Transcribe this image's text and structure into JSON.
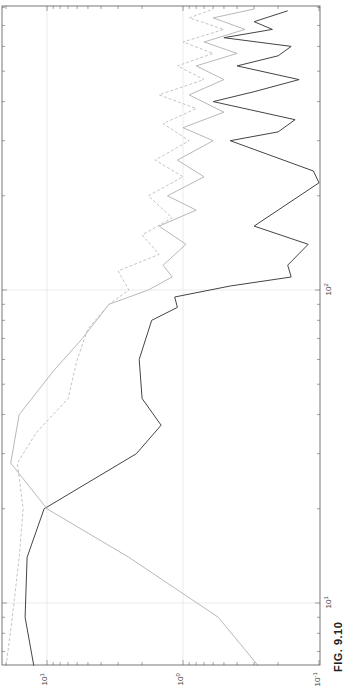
{
  "figure": {
    "label": "FIG. 9.10"
  },
  "chart_data": {
    "type": "line",
    "title": "",
    "orientation": "rotated-90-ccw",
    "xlabel": "",
    "ylabel": "",
    "xscale": "log",
    "yscale": "log",
    "xlim": [
      6,
      800
    ],
    "ylim": [
      0.1,
      20
    ],
    "grid": true,
    "x_tick_labels": [
      "10^1",
      "10^2"
    ],
    "y_tick_labels": [
      "10^-1",
      "10^0",
      "10^1"
    ],
    "legend": null,
    "series": [
      {
        "name": "series-dark-solid",
        "color": "#444444",
        "style": "solid",
        "points": [
          [
            6.3,
            12.5
          ],
          [
            9,
            14.5
          ],
          [
            14,
            14
          ],
          [
            20,
            10.5
          ],
          [
            30,
            2.2
          ],
          [
            37,
            1.45
          ],
          [
            45,
            2.0
          ],
          [
            60,
            2.1
          ],
          [
            80,
            1.7
          ],
          [
            88,
            1.1
          ],
          [
            95,
            1.15
          ],
          [
            103,
            0.45
          ],
          [
            110,
            0.16
          ],
          [
            120,
            0.17
          ],
          [
            140,
            0.12
          ],
          [
            160,
            0.3
          ],
          [
            180,
            0.2
          ],
          [
            220,
            0.1
          ],
          [
            240,
            0.11
          ],
          [
            300,
            0.45
          ],
          [
            320,
            0.2
          ],
          [
            350,
            0.15
          ],
          [
            400,
            0.6
          ],
          [
            430,
            0.3
          ],
          [
            470,
            0.14
          ],
          [
            520,
            0.4
          ],
          [
            560,
            0.2
          ],
          [
            600,
            0.16
          ],
          [
            640,
            0.5
          ],
          [
            680,
            0.22
          ],
          [
            720,
            0.3
          ],
          [
            780,
            0.17
          ]
        ]
      },
      {
        "name": "series-light-solid",
        "color": "#b0b0b0",
        "style": "solid",
        "points": [
          [
            6.3,
            0.28
          ],
          [
            9,
            0.55
          ],
          [
            14,
            2.5
          ],
          [
            20,
            10.0
          ],
          [
            28,
            18.5
          ],
          [
            40,
            16.0
          ],
          [
            55,
            9.0
          ],
          [
            70,
            5.5
          ],
          [
            90,
            3.5
          ],
          [
            100,
            1.8
          ],
          [
            110,
            1.2
          ],
          [
            120,
            1.4
          ],
          [
            140,
            0.95
          ],
          [
            160,
            1.5
          ],
          [
            180,
            0.8
          ],
          [
            200,
            1.3
          ],
          [
            230,
            0.7
          ],
          [
            260,
            1.1
          ],
          [
            300,
            0.6
          ],
          [
            330,
            1.0
          ],
          [
            370,
            0.5
          ],
          [
            420,
            0.9
          ],
          [
            470,
            0.5
          ],
          [
            520,
            0.8
          ],
          [
            570,
            0.4
          ],
          [
            620,
            0.7
          ],
          [
            680,
            0.35
          ],
          [
            740,
            0.6
          ],
          [
            790,
            0.3
          ]
        ]
      },
      {
        "name": "series-light-dashed",
        "color": "#bdbdbd",
        "style": "dashed",
        "points": [
          [
            6.3,
            20
          ],
          [
            9,
            18
          ],
          [
            14,
            16
          ],
          [
            20,
            15
          ],
          [
            28,
            16.5
          ],
          [
            35,
            12
          ],
          [
            45,
            7
          ],
          [
            60,
            6
          ],
          [
            75,
            5
          ],
          [
            90,
            3.5
          ],
          [
            100,
            2.5
          ],
          [
            115,
            3.0
          ],
          [
            130,
            1.5
          ],
          [
            150,
            2.0
          ],
          [
            170,
            1.2
          ],
          [
            200,
            1.8
          ],
          [
            230,
            1.0
          ],
          [
            260,
            1.6
          ],
          [
            300,
            0.9
          ],
          [
            340,
            1.4
          ],
          [
            380,
            0.8
          ],
          [
            420,
            1.5
          ],
          [
            470,
            0.7
          ],
          [
            520,
            1.1
          ],
          [
            570,
            0.6
          ],
          [
            620,
            1.0
          ],
          [
            680,
            0.5
          ],
          [
            740,
            0.9
          ],
          [
            790,
            0.6
          ]
        ]
      }
    ]
  },
  "axes": {
    "value_ticks": [
      {
        "label": "10",
        "exp": "1",
        "value": 10
      },
      {
        "label": "10",
        "exp": "0",
        "value": 1
      },
      {
        "label": "10",
        "exp": "-1",
        "value": 0.1
      }
    ],
    "freq_ticks": [
      {
        "label": "10",
        "exp": "1",
        "value": 10
      },
      {
        "label": "10",
        "exp": "2",
        "value": 100
      }
    ]
  }
}
